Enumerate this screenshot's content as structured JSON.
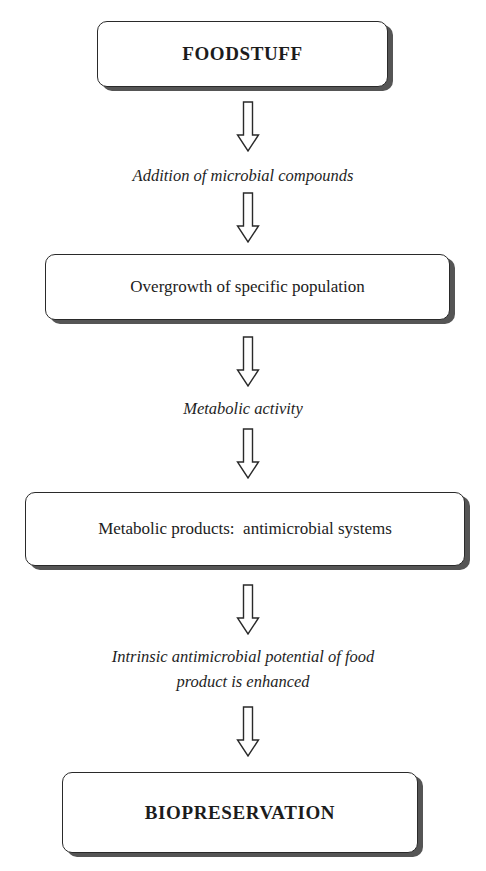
{
  "diagram": {
    "type": "flowchart",
    "direction": "top-to-bottom",
    "colors": {
      "background": "#ffffff",
      "box_border": "#2a2a2a",
      "box_shadow": "#555555",
      "text": "#1e1e1e"
    },
    "nodes": [
      {
        "id": "foodstuff",
        "label": "FOODSTUFF",
        "kind": "box",
        "emphasis": "bold-caps"
      },
      {
        "id": "step1",
        "label": "Addition of microbial compounds",
        "kind": "italic-text"
      },
      {
        "id": "overgrowth",
        "label": "Overgrowth of specific population",
        "kind": "box"
      },
      {
        "id": "step2",
        "label": "Metabolic activity",
        "kind": "italic-text"
      },
      {
        "id": "products",
        "label": "Metabolic products:  antimicrobial systems",
        "kind": "box"
      },
      {
        "id": "step3",
        "label_line1": "Intrinsic antimicrobial potential of food",
        "label_line2": "product is enhanced",
        "kind": "italic-text"
      },
      {
        "id": "biopreservation",
        "label": "BIOPRESERVATION",
        "kind": "box",
        "emphasis": "bold-caps"
      }
    ],
    "arrows": [
      {
        "from": "foodstuff",
        "to": "step1",
        "icon": "hollow-down-arrow"
      },
      {
        "from": "step1",
        "to": "overgrowth",
        "icon": "hollow-down-arrow"
      },
      {
        "from": "overgrowth",
        "to": "step2",
        "icon": "hollow-down-arrow"
      },
      {
        "from": "step2",
        "to": "products",
        "icon": "hollow-down-arrow"
      },
      {
        "from": "products",
        "to": "step3",
        "icon": "hollow-down-arrow"
      },
      {
        "from": "step3",
        "to": "biopreservation",
        "icon": "hollow-down-arrow"
      }
    ]
  }
}
